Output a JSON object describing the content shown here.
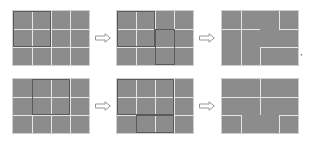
{
  "diagram": {
    "colors": {
      "cell": "#8c8c8c",
      "line": "#e6e6e6",
      "frame": "#5a5a5a",
      "border": "#cfcfcf"
    },
    "arrow_icon": "right-outline-arrow",
    "trailing_mark": ",",
    "rows": [
      {
        "steps": [
          {
            "x": 13,
            "y": 11,
            "v": [
              [
                19,
                0,
                54
              ],
              [
                38,
                0,
                54
              ],
              [
                57,
                0,
                54
              ]
            ],
            "h": [
              [
                18,
                0,
                76
              ],
              [
                36,
                0,
                76
              ]
            ],
            "frames": [
              [
                0,
                0,
                38,
                36
              ]
            ]
          },
          {
            "x": 117,
            "y": 11,
            "v": [
              [
                19,
                0,
                54
              ],
              [
                38,
                0,
                54
              ],
              [
                57,
                0,
                54
              ]
            ],
            "h": [
              [
                18,
                0,
                76
              ],
              [
                36,
                0,
                76
              ]
            ],
            "frames": [
              [
                0,
                0,
                38,
                36
              ],
              [
                38,
                18,
                20,
                36
              ]
            ]
          },
          {
            "x": 222,
            "y": 11,
            "v": [
              [
                19,
                0,
                36
              ],
              [
                19,
                36,
                18
              ],
              [
                38,
                36,
                18
              ],
              [
                57,
                0,
                18
              ]
            ],
            "h": [
              [
                18,
                0,
                38
              ],
              [
                18,
                57,
                19
              ],
              [
                36,
                38,
                38
              ]
            ],
            "frames": []
          }
        ]
      },
      {
        "steps": [
          {
            "x": 13,
            "y": 79,
            "v": [
              [
                19,
                0,
                54
              ],
              [
                38,
                0,
                54
              ],
              [
                57,
                0,
                54
              ]
            ],
            "h": [
              [
                18,
                0,
                76
              ],
              [
                36,
                0,
                76
              ]
            ],
            "frames": [
              [
                19,
                0,
                38,
                36
              ]
            ]
          },
          {
            "x": 117,
            "y": 79,
            "v": [
              [
                19,
                0,
                54
              ],
              [
                38,
                0,
                54
              ],
              [
                57,
                0,
                54
              ]
            ],
            "h": [
              [
                18,
                0,
                76
              ],
              [
                36,
                0,
                76
              ]
            ],
            "frames": [
              [
                0,
                0,
                57,
                36
              ],
              [
                19,
                36,
                38,
                18
              ]
            ]
          },
          {
            "x": 222,
            "y": 79,
            "v": [
              [
                38,
                0,
                36
              ],
              [
                19,
                36,
                18
              ],
              [
                57,
                36,
                18
              ]
            ],
            "h": [
              [
                18,
                0,
                76
              ],
              [
                36,
                0,
                19
              ],
              [
                36,
                57,
                19
              ]
            ],
            "frames": []
          }
        ]
      }
    ],
    "arrows": [
      {
        "x": 95,
        "y": 33
      },
      {
        "x": 199,
        "y": 33
      },
      {
        "x": 95,
        "y": 101
      },
      {
        "x": 199,
        "y": 101
      }
    ]
  }
}
